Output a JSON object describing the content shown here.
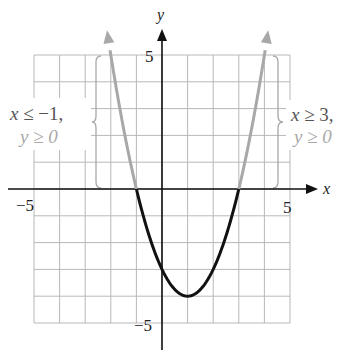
{
  "chart_data": {
    "type": "line",
    "title": "",
    "function": "y = x^2 - 2x - 3",
    "xlabel": "x",
    "ylabel": "y",
    "xlim": [
      -5,
      5
    ],
    "ylim": [
      -5,
      5
    ],
    "grid": true,
    "tick_labels": {
      "x": [
        "-5",
        "5"
      ],
      "y": [
        "5",
        "-5"
      ]
    },
    "series": [
      {
        "name": "left branch (x ≤ -1, y ≥ 0)",
        "color": "#a8a8a8",
        "x": [
          -2.15,
          -2,
          -1.5,
          -1
        ],
        "y": [
          5.92,
          5,
          2.25,
          0
        ]
      },
      {
        "name": "middle branch (-1 ≤ x ≤ 3, y ≤ 0)",
        "color": "#111111",
        "x": [
          -1,
          0,
          1,
          2,
          3
        ],
        "y": [
          0,
          -3,
          -4,
          -3,
          0
        ]
      },
      {
        "name": "right branch (x ≥ 3, y ≥ 0)",
        "color": "#a8a8a8",
        "x": [
          3,
          3.5,
          4,
          4.15
        ],
        "y": [
          0,
          2.25,
          5,
          5.92
        ]
      }
    ],
    "key_points": {
      "vertex": [
        1,
        -4
      ],
      "x_intercepts": [
        -1,
        3
      ],
      "y_intercept": -3
    },
    "annotations": [
      {
        "text_line1": "x ≤ −1,",
        "text_line2": "y ≥ 0",
        "position": "left",
        "brace_y_range": [
          0,
          5
        ]
      },
      {
        "text_line1": "x ≥ 3,",
        "text_line2": "y ≥ 0",
        "position": "right",
        "brace_y_range": [
          0,
          5
        ]
      }
    ]
  },
  "axes": {
    "x_label": "x",
    "y_label": "y",
    "x_min_tick": "−5",
    "x_max_tick": "5",
    "y_max_tick": "5",
    "y_min_tick": "−5"
  },
  "annotations": {
    "left": {
      "line1_var": "x",
      "line1_rest": " ≤ −1,",
      "line2": "y ≥ 0"
    },
    "right": {
      "line1_var": "x",
      "line1_rest": " ≥ 3,",
      "line2": "y ≥ 0"
    }
  },
  "colors": {
    "grid": "#b8b8b8",
    "axis": "#111111",
    "curve_dark": "#111111",
    "curve_light": "#a8a8a8",
    "label_dark": "#555555",
    "label_light": "#a8a8a8"
  }
}
